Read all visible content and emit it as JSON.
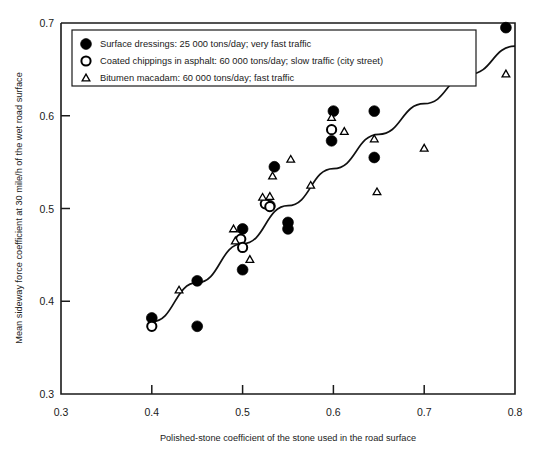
{
  "chart_data": {
    "type": "scatter",
    "title": "",
    "xlabel": "Polished-stone coefficient of the stone used in the road surface",
    "ylabel": "Mean sideway force coefficient at 30 mile/h of the wet road surface",
    "xlim": [
      0.3,
      0.8
    ],
    "ylim": [
      0.3,
      0.7
    ],
    "xticks": [
      "0.3",
      "0.4",
      "0.5",
      "0.6",
      "0.7",
      "0.8"
    ],
    "xtick_values": [
      0.3,
      0.4,
      0.5,
      0.6,
      0.7,
      0.8
    ],
    "yticks": [
      "0.3",
      "0.4",
      "0.5",
      "0.6",
      "0.7"
    ],
    "ytick_values": [
      0.3,
      0.4,
      0.5,
      0.6,
      0.7
    ],
    "grid": false,
    "legend_position": "top-left",
    "series": [
      {
        "name": "Surface dressings: 25 000 tons/day; very fast traffic",
        "marker": "filled-circle",
        "points": [
          [
            0.4,
            0.382
          ],
          [
            0.45,
            0.422
          ],
          [
            0.45,
            0.373
          ],
          [
            0.5,
            0.478
          ],
          [
            0.5,
            0.434
          ],
          [
            0.53,
            0.503
          ],
          [
            0.535,
            0.545
          ],
          [
            0.55,
            0.485
          ],
          [
            0.55,
            0.478
          ],
          [
            0.598,
            0.573
          ],
          [
            0.6,
            0.605
          ],
          [
            0.645,
            0.605
          ],
          [
            0.645,
            0.555
          ],
          [
            0.79,
            0.695
          ]
        ]
      },
      {
        "name": "Coated chippings in asphalt: 60 000 tons/day; slow traffic (city street)",
        "marker": "open-circle",
        "points": [
          [
            0.4,
            0.373
          ],
          [
            0.498,
            0.467
          ],
          [
            0.5,
            0.458
          ],
          [
            0.525,
            0.505
          ],
          [
            0.53,
            0.502
          ],
          [
            0.598,
            0.585
          ]
        ]
      },
      {
        "name": "Bitumen macadam: 60 000 tons/day; fast traffic",
        "marker": "open-triangle",
        "points": [
          [
            0.43,
            0.412
          ],
          [
            0.49,
            0.478
          ],
          [
            0.492,
            0.465
          ],
          [
            0.508,
            0.445
          ],
          [
            0.522,
            0.512
          ],
          [
            0.53,
            0.513
          ],
          [
            0.533,
            0.535
          ],
          [
            0.553,
            0.553
          ],
          [
            0.575,
            0.525
          ],
          [
            0.598,
            0.598
          ],
          [
            0.612,
            0.583
          ],
          [
            0.645,
            0.575
          ],
          [
            0.648,
            0.518
          ],
          [
            0.7,
            0.565
          ],
          [
            0.79,
            0.645
          ]
        ]
      }
    ],
    "trend_line": {
      "name": "fitted-trend-curve",
      "points": [
        [
          0.4,
          0.378
        ],
        [
          0.45,
          0.42
        ],
        [
          0.5,
          0.462
        ],
        [
          0.55,
          0.503
        ],
        [
          0.6,
          0.543
        ],
        [
          0.65,
          0.58
        ],
        [
          0.7,
          0.613
        ],
        [
          0.75,
          0.645
        ],
        [
          0.8,
          0.675
        ]
      ]
    }
  },
  "legend": {
    "items": [
      {
        "marker": "filled-circle",
        "label": "Surface dressings: 25 000 tons/day; very fast traffic"
      },
      {
        "marker": "open-circle",
        "label": "Coated chippings in asphalt: 60 000 tons/day; slow traffic (city street)"
      },
      {
        "marker": "open-triangle",
        "label": "Bitumen macadam: 60 000 tons/day; fast traffic"
      }
    ]
  },
  "colors": {
    "ink": "#000000",
    "axis": "#1a1a1a",
    "background": "#ffffff"
  }
}
